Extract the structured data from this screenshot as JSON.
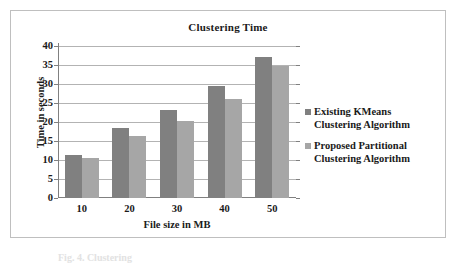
{
  "figure": {
    "caption": "Fig. 4.  Clustering"
  },
  "legend": {
    "entries": [
      {
        "label_line1": "Existing KMeans",
        "label_line2": "Clustering Algorithm",
        "color": "#808080"
      },
      {
        "label_line1": "Proposed Partitional",
        "label_line2": "Clustering Algorithm",
        "color": "#a6a6a6"
      }
    ]
  },
  "chart_data": {
    "type": "bar",
    "title": "Clustering Time",
    "xlabel": "File size in MB",
    "ylabel": "Time in seconds",
    "categories": [
      "10",
      "20",
      "30",
      "40",
      "50"
    ],
    "yticks": [
      0,
      5,
      10,
      15,
      20,
      25,
      30,
      35,
      40
    ],
    "ylim": [
      0,
      40
    ],
    "grid": true,
    "legend_position": "right",
    "series": [
      {
        "name": "Existing KMeans Clustering Algorithm",
        "color": "#808080",
        "values": [
          11.2,
          18.3,
          23.1,
          29.4,
          37.0
        ]
      },
      {
        "name": "Proposed Partitional Clustering Algorithm",
        "color": "#a6a6a6",
        "values": [
          10.4,
          16.2,
          20.2,
          26.0,
          34.7
        ]
      }
    ]
  }
}
